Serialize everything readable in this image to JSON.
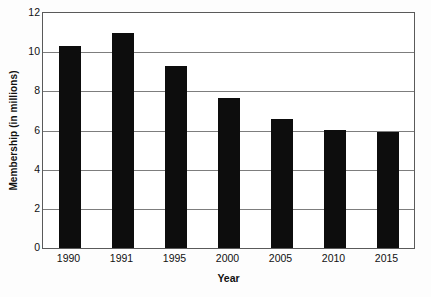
{
  "chart_data": {
    "type": "bar",
    "title": "",
    "xlabel": "Year",
    "ylabel": "Membership (in millions)",
    "categories": [
      "1990",
      "1991",
      "1995",
      "2000",
      "2005",
      "2010",
      "2015"
    ],
    "values": [
      10.3,
      11.0,
      9.3,
      7.65,
      6.6,
      6.05,
      5.9
    ],
    "series": [
      {
        "name": "Membership",
        "values": [
          10.3,
          11.0,
          9.3,
          7.65,
          6.6,
          6.05,
          5.9
        ]
      }
    ],
    "ylim": [
      0,
      12
    ],
    "xlim_categories": 7,
    "y_ticks": [
      0,
      2,
      4,
      6,
      8,
      10,
      12
    ],
    "y_tick_labels": [
      "0",
      "2",
      "4",
      "6",
      "8",
      "10",
      "12"
    ],
    "grid": "horizontal",
    "legend": "none",
    "bar_color": "#0d0d0d",
    "gridline_color": "#7d7d7d",
    "axis_color": "#5a5a5a",
    "background_color": "#ffffff"
  }
}
